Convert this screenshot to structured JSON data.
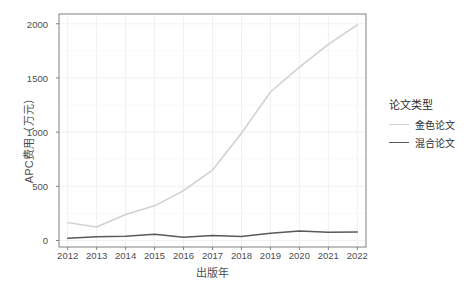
{
  "chart_data": {
    "type": "line",
    "title": "",
    "xlabel": "出版年",
    "ylabel": "APC费用（万元）",
    "x": [
      2012,
      2013,
      2014,
      2015,
      2016,
      2017,
      2018,
      2019,
      2020,
      2021,
      2022
    ],
    "xtick_labels": [
      "2012",
      "2013",
      "2014",
      "2015",
      "2016",
      "2017",
      "2018",
      "2019",
      "2020",
      "2021",
      "2022"
    ],
    "ytick_labels": [
      "0",
      "500",
      "1000",
      "1500",
      "2000"
    ],
    "yticks": [
      0,
      500,
      1000,
      1500,
      2000
    ],
    "ylim": [
      -60,
      2090
    ],
    "xlim": [
      2011.7,
      2022.3
    ],
    "grid": true,
    "legend_position": "right",
    "legend_title": "论文类型",
    "series": [
      {
        "name": "金色论文",
        "color": "#d0d0d0",
        "values": [
          165,
          125,
          240,
          320,
          460,
          650,
          990,
          1370,
          1600,
          1810,
          1990
        ]
      },
      {
        "name": "混合论文",
        "color": "#595959",
        "values": [
          20,
          35,
          40,
          58,
          30,
          45,
          38,
          68,
          88,
          75,
          78
        ]
      }
    ]
  },
  "panel": {
    "background": "#ffffff",
    "border_color": "#808080",
    "grid_color": "#f0f0f0"
  }
}
